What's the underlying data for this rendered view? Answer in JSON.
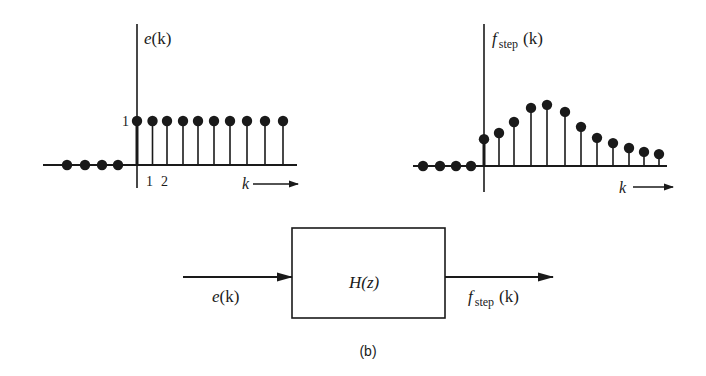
{
  "figure": {
    "caption": "(b)",
    "colors": {
      "ink": "#1a1a1a",
      "background": "#ffffff"
    }
  },
  "input_plot": {
    "ylabel_fn": "e",
    "ylabel_arg": "(k)",
    "tick_y_one": "1",
    "tick_x": [
      "1",
      "2"
    ],
    "xlabel": "k"
  },
  "output_plot": {
    "ylabel_fn": "f",
    "ylabel_sub": "step",
    "ylabel_arg": "(k)",
    "xlabel": "k"
  },
  "block": {
    "label": "H(z)",
    "input_fn": "e",
    "input_arg": "(k)",
    "output_fn": "f",
    "output_sub": "step",
    "output_arg": "(k)"
  },
  "chart_data": [
    {
      "type": "stem",
      "title": "e(k)",
      "xlabel": "k",
      "ylabel": "e(k)",
      "x": [
        -4,
        -3,
        -2,
        -1,
        0,
        1,
        2,
        3,
        4,
        5,
        6,
        7,
        8,
        9
      ],
      "values": [
        0,
        0,
        0,
        0,
        1,
        1,
        1,
        1,
        1,
        1,
        1,
        1,
        1,
        1
      ],
      "tick_labels": {
        "x": [
          "1",
          "2"
        ],
        "y": [
          "1"
        ]
      },
      "grid": false
    },
    {
      "type": "stem",
      "title": "f_step(k)",
      "xlabel": "k",
      "ylabel": "f_step(k)",
      "x": [
        -4,
        -3,
        -2,
        -1,
        0,
        1,
        2,
        3,
        4,
        5,
        6,
        7,
        8,
        9,
        10,
        11
      ],
      "values": [
        0,
        0,
        0,
        0,
        0.61,
        0.75,
        1.0,
        1.32,
        1.39,
        1.23,
        0.89,
        0.64,
        0.52,
        0.41,
        0.32,
        0.27
      ],
      "grid": false
    }
  ]
}
